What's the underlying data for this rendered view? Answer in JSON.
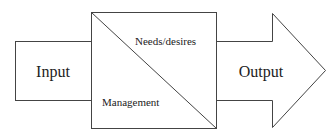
{
  "diagram": {
    "input_label": "Input",
    "output_label": "Output",
    "upper_triangle_label": "Needs/desires",
    "lower_triangle_label": "Management",
    "stroke_color": "#444444"
  }
}
